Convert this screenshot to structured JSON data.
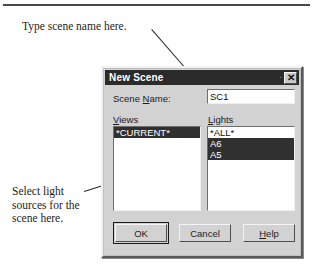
{
  "annotations": {
    "top": "Type scene name here.",
    "left": "Select light\nsources for the\nscene here."
  },
  "dialog": {
    "title": "New Scene",
    "close_label": "✕",
    "minimize_mark": "·",
    "scene_name": {
      "label_before": "Scene ",
      "label_accel": "N",
      "label_after": "ame:",
      "value": "SC1"
    },
    "views": {
      "label_accel": "V",
      "label_after": "iews",
      "items": [
        {
          "text": "*CURRENT*",
          "selected": true
        }
      ]
    },
    "lights": {
      "label_accel": "L",
      "label_after": "ights",
      "items": [
        {
          "text": "*ALL*",
          "selected": false
        },
        {
          "text": "A6",
          "selected": true
        },
        {
          "text": "A5",
          "selected": true
        }
      ]
    },
    "buttons": {
      "ok": "OK",
      "cancel": "Cancel",
      "help_accel": "H",
      "help_after": "elp"
    }
  },
  "colors": {
    "dialog_face": "#d2d2d2",
    "titlebar": "#2b2b2b",
    "selection": "#303030",
    "field_background": "#ffffff",
    "text": "#1c1c1c"
  }
}
